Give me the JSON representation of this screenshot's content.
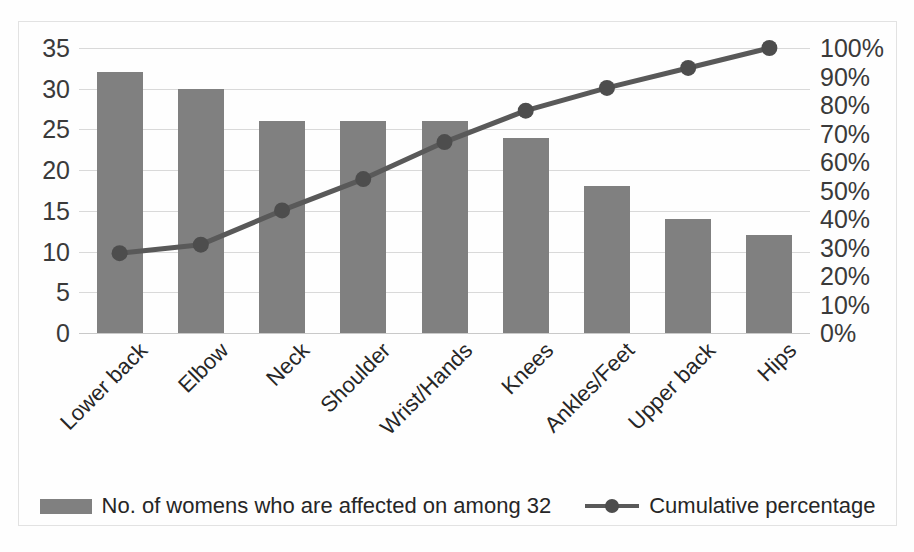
{
  "chart_data": {
    "type": "bar",
    "title": "",
    "subtitle": "",
    "xlabel": "",
    "ylabel": "",
    "y2label": "",
    "categories": [
      "Lower back",
      "Elbow",
      "Neck",
      "Shoulder",
      "Wrist/Hands",
      "Knees",
      "Ankles/Feet",
      "Upper back",
      "Hips"
    ],
    "series": [
      {
        "name": "No. of womens who are affected on among 32",
        "type": "bar",
        "axis": "left",
        "values": [
          32,
          30,
          26,
          26,
          26,
          24,
          18,
          14,
          12
        ],
        "color": "#808080"
      },
      {
        "name": "Cumulative percentage",
        "type": "line",
        "axis": "right",
        "values": [
          28,
          31,
          43,
          54,
          67,
          78,
          86,
          93,
          100
        ],
        "value_labels": [
          "28%",
          "31%",
          "43%",
          "54%",
          "67%",
          "78%",
          "86%",
          "93%",
          "100%"
        ],
        "color": "#595959",
        "marker_color": "#4d4d4d"
      }
    ],
    "ylim": [
      0,
      35
    ],
    "y2lim": [
      0,
      100
    ],
    "yticks": [
      0,
      5,
      10,
      15,
      20,
      25,
      30,
      35
    ],
    "ytick_labels": [
      "0",
      "5",
      "10",
      "15",
      "20",
      "25",
      "30",
      "35"
    ],
    "y2ticks": [
      0,
      10,
      20,
      30,
      40,
      50,
      60,
      70,
      80,
      90,
      100
    ],
    "y2tick_labels": [
      "0%",
      "10%",
      "20%",
      "30%",
      "40%",
      "50%",
      "60%",
      "70%",
      "80%",
      "90%",
      "100%"
    ],
    "grid": true,
    "grid_color": "#d9d9d9",
    "legend_position": "bottom",
    "border_color": "#e2e2e2",
    "background": "#ffffff"
  },
  "legend": {
    "items": [
      {
        "label": "No. of womens who are affected on among 32",
        "marker": "square-swatch"
      },
      {
        "label": "Cumulative percentage",
        "marker": "line-with-dot"
      }
    ]
  }
}
